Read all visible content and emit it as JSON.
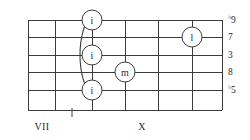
{
  "diagram": {
    "kind": "guitar-fretboard-chord-diagram",
    "title": "",
    "colors": {
      "line": "#3c3c3c",
      "text": "#2a2a2a",
      "background": "#ffffff",
      "circle_fill": "#ffffff"
    },
    "geometry": {
      "strings_y": [
        20,
        37,
        55,
        72,
        90,
        110
      ],
      "frets_x": [
        28,
        55,
        92,
        125,
        158,
        192,
        222
      ],
      "string_x_start": 28,
      "string_x_end": 222,
      "fret_y_top": 20,
      "fret_y_bottom": 110
    },
    "grid": {
      "string_count": 6,
      "fret_line_count": 7
    },
    "barre": {
      "present": true,
      "label": "barre",
      "start_string_index": 0,
      "end_string_index": 4,
      "x_anchor": 92,
      "bulge_x": 76
    },
    "fingerings": [
      {
        "finger": "i",
        "string_index": 0,
        "fret_x": 92,
        "string_y": 20,
        "radius": 10
      },
      {
        "finger": "i",
        "string_index": 2,
        "fret_x": 92,
        "string_y": 55,
        "radius": 10
      },
      {
        "finger": "i",
        "string_index": 4,
        "fret_x": 92,
        "string_y": 90,
        "radius": 10
      },
      {
        "finger": "m",
        "string_index": 3,
        "fret_x": 125,
        "string_y": 72,
        "radius": 10
      },
      {
        "finger": "l",
        "string_index": 1,
        "fret_x": 192,
        "string_y": 37,
        "radius": 10
      }
    ],
    "interval_labels": [
      {
        "accidental": "♭",
        "degree": "9",
        "string_index": 0,
        "y": 20
      },
      {
        "accidental": "",
        "degree": "7",
        "string_index": 1,
        "y": 37
      },
      {
        "accidental": "",
        "degree": "3",
        "string_index": 2,
        "y": 55
      },
      {
        "accidental": "",
        "degree": "8",
        "string_index": 3,
        "y": 72
      },
      {
        "accidental": "♭",
        "degree": "5",
        "string_index": 4,
        "y": 90
      }
    ],
    "position_labels": [
      {
        "text": "VII",
        "x": 42,
        "y": 126
      },
      {
        "text": "X",
        "x": 142,
        "y": 126
      }
    ],
    "tick_marks": [
      {
        "x": 72,
        "y_top": 108,
        "y_bottom": 117
      }
    ]
  }
}
